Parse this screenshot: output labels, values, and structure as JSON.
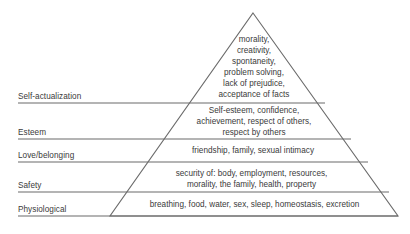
{
  "diagram": {
    "type": "pyramid",
    "background_color": "#ffffff",
    "line_color": "#6b6b6b",
    "text_color": "#3a3a3a",
    "apex": {
      "x": 253,
      "y": 13
    },
    "base_left": {
      "x": 110,
      "y": 216
    },
    "base_right": {
      "x": 398,
      "y": 216
    },
    "label_line_start_x": 18
  },
  "tiers": [
    {
      "id": "self-actualization",
      "label": "Self-actualization",
      "divider_y": 103,
      "lines": [
        "morality,",
        "creativity,",
        "spontaneity,",
        "problem solving,",
        "lack of prejudice,",
        "acceptance of facts"
      ]
    },
    {
      "id": "esteem",
      "label": "Esteem",
      "divider_y": 139,
      "lines": [
        "Self-esteem, confidence,",
        "achievement, respect of others,",
        "respect by others"
      ]
    },
    {
      "id": "love-belonging",
      "label": "Love/belonging",
      "divider_y": 162,
      "lines": [
        "friendship, family, sexual intimacy"
      ]
    },
    {
      "id": "safety",
      "label": "Safety",
      "divider_y": 192,
      "lines": [
        "security of: body, employment, resources,",
        "morality, the family, health, property"
      ]
    },
    {
      "id": "physiological",
      "label": "Physiological",
      "divider_y": 216,
      "lines": [
        "breathing, food, water, sex, sleep, homeostasis, excretion"
      ]
    }
  ]
}
